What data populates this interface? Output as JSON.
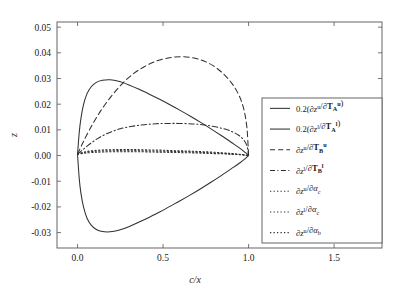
{
  "chart_data": {
    "type": "line",
    "title": "",
    "subtitle": "",
    "xlabel": "c/x",
    "ylabel": "z",
    "xlim": [
      -0.12,
      1.78
    ],
    "ylim": [
      -0.036,
      0.052
    ],
    "xticks": [
      0.0,
      0.5,
      1.0,
      1.5
    ],
    "xtick_labels": [
      "0.0",
      "0.5",
      "1.0",
      "1.5"
    ],
    "yticks": [
      -0.03,
      -0.02,
      -0.01,
      0.0,
      0.01,
      0.02,
      0.03,
      0.04,
      0.05
    ],
    "ytick_labels": [
      "-0.03",
      "-0.02",
      "-0.01",
      "0.00",
      "0.01",
      "0.02",
      "0.03",
      "0.04",
      "0.05"
    ],
    "grid": false,
    "legend_position": "right",
    "line_color": "#303030",
    "axis_color": "#555555",
    "background": "#ffffff",
    "series": [
      {
        "name": "0.2(dz^u/dT_A^u)",
        "style": "solid",
        "peak_x": 0.19,
        "peak_y": 0.0295,
        "x": [
          0.0,
          0.01,
          0.02,
          0.035,
          0.055,
          0.08,
          0.11,
          0.145,
          0.19,
          0.24,
          0.3,
          0.36,
          0.42,
          0.48,
          0.54,
          0.6,
          0.66,
          0.72,
          0.78,
          0.84,
          0.9,
          0.95,
          0.98,
          1.0
        ],
        "y": [
          0.0005,
          0.009,
          0.0145,
          0.0198,
          0.024,
          0.0268,
          0.0285,
          0.0293,
          0.0295,
          0.0289,
          0.0275,
          0.0258,
          0.0239,
          0.0219,
          0.0198,
          0.0176,
          0.0153,
          0.0129,
          0.0104,
          0.0078,
          0.0051,
          0.0028,
          0.0012,
          0.0
        ]
      },
      {
        "name": "0.2(dz^l/dT_A^l)",
        "style": "solid",
        "peak_x": 0.19,
        "peak_y": -0.0297,
        "x": [
          0.0,
          0.01,
          0.02,
          0.035,
          0.055,
          0.08,
          0.11,
          0.145,
          0.19,
          0.24,
          0.3,
          0.36,
          0.42,
          0.48,
          0.54,
          0.6,
          0.66,
          0.72,
          0.78,
          0.84,
          0.9,
          0.95,
          0.98,
          1.0
        ],
        "y": [
          0.0005,
          -0.009,
          -0.0147,
          -0.02,
          -0.0243,
          -0.0271,
          -0.0288,
          -0.0296,
          -0.0297,
          -0.0291,
          -0.0277,
          -0.0259,
          -0.024,
          -0.022,
          -0.0198,
          -0.0176,
          -0.0153,
          -0.0129,
          -0.0104,
          -0.0078,
          -0.0051,
          -0.0028,
          -0.0012,
          0.0
        ]
      },
      {
        "name": "dz^u/dT_B^u",
        "style": "dashed",
        "peak_x": 0.6,
        "peak_y": 0.0385,
        "x": [
          0.0,
          0.03,
          0.07,
          0.12,
          0.18,
          0.25,
          0.32,
          0.39,
          0.46,
          0.53,
          0.6,
          0.67,
          0.73,
          0.79,
          0.85,
          0.9,
          0.94,
          0.97,
          0.99,
          1.0
        ],
        "y": [
          0.0005,
          0.0048,
          0.01,
          0.0158,
          0.0216,
          0.0272,
          0.0315,
          0.0346,
          0.0368,
          0.038,
          0.0385,
          0.0381,
          0.037,
          0.0351,
          0.032,
          0.0283,
          0.024,
          0.0186,
          0.011,
          0.0
        ]
      },
      {
        "name": "dz^l/dT_B^l",
        "style": "dashdot",
        "peak_x": 0.6,
        "peak_y": 0.0125,
        "x": [
          0.0,
          0.03,
          0.07,
          0.12,
          0.18,
          0.25,
          0.32,
          0.39,
          0.46,
          0.53,
          0.6,
          0.67,
          0.73,
          0.79,
          0.85,
          0.9,
          0.94,
          0.97,
          0.99,
          1.0
        ],
        "y": [
          0.0005,
          0.0022,
          0.0044,
          0.0067,
          0.0088,
          0.0104,
          0.0114,
          0.012,
          0.0124,
          0.0125,
          0.0125,
          0.0123,
          0.012,
          0.0114,
          0.0105,
          0.0094,
          0.008,
          0.0062,
          0.0038,
          0.0
        ]
      },
      {
        "name": "dz^u/dalpha_c",
        "style": "dotted",
        "peak_x": 0.35,
        "peak_y": 0.0023,
        "x": [
          0.0,
          0.04,
          0.09,
          0.15,
          0.22,
          0.29,
          0.35,
          0.42,
          0.49,
          0.56,
          0.63,
          0.7,
          0.77,
          0.84,
          0.9,
          0.95,
          0.98,
          1.0
        ],
        "y": [
          0.0005,
          0.0014,
          0.0019,
          0.0022,
          0.0023,
          0.0023,
          0.0023,
          0.0022,
          0.0021,
          0.0019,
          0.0018,
          0.0016,
          0.0014,
          0.0011,
          0.0008,
          0.0005,
          0.0002,
          0.0
        ]
      },
      {
        "name": "dz^l/dalpha_c",
        "style": "dotted",
        "peak_x": 0.35,
        "peak_y": 0.0019,
        "x": [
          0.0,
          0.04,
          0.09,
          0.15,
          0.22,
          0.29,
          0.35,
          0.42,
          0.49,
          0.56,
          0.63,
          0.7,
          0.77,
          0.84,
          0.9,
          0.95,
          0.98,
          1.0
        ],
        "y": [
          0.0005,
          0.0012,
          0.0016,
          0.0018,
          0.0019,
          0.0019,
          0.0019,
          0.0018,
          0.0017,
          0.0016,
          0.0015,
          0.0013,
          0.0011,
          0.0009,
          0.0006,
          0.0004,
          0.0002,
          0.0
        ]
      },
      {
        "name": "dz^u/dalpha_b",
        "style": "dotted",
        "peak_x": 0.35,
        "peak_y": 0.0015,
        "x": [
          0.0,
          0.04,
          0.09,
          0.15,
          0.22,
          0.29,
          0.35,
          0.42,
          0.49,
          0.56,
          0.63,
          0.7,
          0.77,
          0.84,
          0.9,
          0.95,
          0.98,
          1.0
        ],
        "y": [
          0.0005,
          0.0009,
          0.0012,
          0.0014,
          0.0015,
          0.0015,
          0.0015,
          0.0014,
          0.0013,
          0.0012,
          0.0011,
          0.001,
          0.0008,
          0.0007,
          0.0005,
          0.0003,
          0.0001,
          0.0
        ]
      }
    ],
    "legend_entries": [
      {
        "style": "solid",
        "label": "0.2(∂zᵘ/∂Tᴀᵘ)",
        "prefix": "0.2(",
        "num": "z",
        "num_sup": "u",
        "den": "T",
        "den_sub": "A",
        "den_sup": "u",
        "suffix": ")"
      },
      {
        "style": "solid",
        "label": "0.2(∂zˡ/∂Tᴀˡ)",
        "prefix": "0.2(",
        "num": "z",
        "num_sup": "l",
        "den": "T",
        "den_sub": "A",
        "den_sup": "l",
        "suffix": ")"
      },
      {
        "style": "dashed",
        "label": "∂zᵘ/∂Tʙᵘ",
        "prefix": "",
        "num": "z",
        "num_sup": "u",
        "den": "T",
        "den_sub": "B",
        "den_sup": "u",
        "suffix": ""
      },
      {
        "style": "dashdot",
        "label": "∂zˡ/∂Tʙˡ",
        "prefix": "",
        "num": "z",
        "num_sup": "l",
        "den": "T",
        "den_sub": "B",
        "den_sup": "l",
        "suffix": ""
      },
      {
        "style": "dotted",
        "label": "∂zᵘ/∂αc",
        "prefix": "",
        "num": "z",
        "num_sup": "u",
        "den": "α",
        "den_sub": "c",
        "den_sup": "",
        "suffix": ""
      },
      {
        "style": "dotted",
        "label": "∂zˡ/∂αc",
        "prefix": "",
        "num": "z",
        "num_sup": "l",
        "den": "α",
        "den_sub": "c",
        "den_sup": "",
        "suffix": ""
      },
      {
        "style": "dotted",
        "label": "∂zᵘ/∂αb",
        "prefix": "",
        "num": "z",
        "num_sup": "u",
        "den": "α",
        "den_sub": "b",
        "den_sup": "",
        "suffix": ""
      }
    ]
  }
}
